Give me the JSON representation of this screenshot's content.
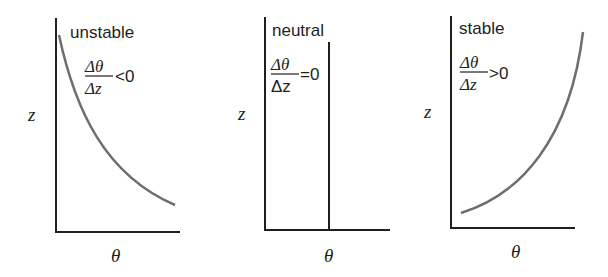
{
  "colors": {
    "axis": "#231f20",
    "curve": "#6d6e71",
    "background": "#ffffff"
  },
  "panels": [
    {
      "id": "unstable",
      "title": "unstable",
      "y_axis_label": "z",
      "x_axis_label": "θ",
      "fraction_numerator": "Δθ",
      "fraction_denominator": "Δz",
      "relation": "<0",
      "curve_shape": "decreasing concave-up (θ decreases with height)"
    },
    {
      "id": "neutral",
      "title": "neutral",
      "y_axis_label": "z",
      "x_axis_label": "θ",
      "fraction_numerator": "Δθ",
      "fraction_denominator": "Δz",
      "relation": "=0",
      "curve_shape": "vertical line (θ constant with height)"
    },
    {
      "id": "stable",
      "title": "stable",
      "y_axis_label": "z",
      "x_axis_label": "θ",
      "fraction_numerator": "Δθ",
      "fraction_denominator": "Δz",
      "relation": ">0",
      "curve_shape": "increasing concave-up (θ increases with height)"
    }
  ]
}
